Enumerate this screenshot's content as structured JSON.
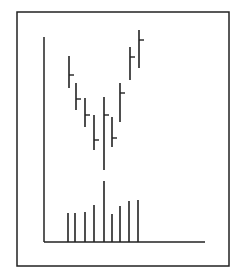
{
  "chart_data": {
    "type": "bar",
    "subtype": "ohlc-with-volume",
    "title": "",
    "xlabel": "",
    "ylabel": "",
    "grid": false,
    "legend": null,
    "frame": {
      "x": 17,
      "y": 12,
      "w": 212,
      "h": 254
    },
    "axes": {
      "origin_x": 44,
      "origin_y": 242,
      "y_top": 37,
      "x_end": 205
    },
    "categories": [
      1,
      2,
      3,
      4,
      5,
      6,
      7,
      8,
      9
    ],
    "price_bars": [
      {
        "x": 69,
        "high": 56,
        "low": 88,
        "close": 75
      },
      {
        "x": 76,
        "high": 83,
        "low": 110,
        "close": 99
      },
      {
        "x": 85,
        "high": 98,
        "low": 127,
        "close": 115
      },
      {
        "x": 94,
        "high": 115,
        "low": 150,
        "close": 140
      },
      {
        "x": 104,
        "high": 97,
        "low": 170,
        "close": 115
      },
      {
        "x": 112,
        "high": 117,
        "low": 147,
        "close": 138
      },
      {
        "x": 120,
        "high": 83,
        "low": 122,
        "close": 93
      },
      {
        "x": 130,
        "high": 47,
        "low": 80,
        "close": 57
      },
      {
        "x": 139,
        "high": 30,
        "low": 68,
        "close": 40
      }
    ],
    "volume_bars": [
      {
        "x": 68,
        "top": 213
      },
      {
        "x": 75,
        "top": 213
      },
      {
        "x": 85,
        "top": 212
      },
      {
        "x": 94,
        "top": 205
      },
      {
        "x": 104,
        "top": 181
      },
      {
        "x": 112,
        "top": 214
      },
      {
        "x": 120,
        "top": 206
      },
      {
        "x": 129,
        "top": 201
      },
      {
        "x": 138,
        "top": 200
      }
    ],
    "relative_values": {
      "price_high": [
        68,
        57,
        51,
        44,
        52,
        44,
        57,
        71,
        78
      ],
      "price_low": [
        55,
        44,
        37,
        28,
        20,
        31,
        47,
        60,
        65
      ],
      "price_close": [
        62,
        50,
        44,
        34,
        44,
        35,
        53,
        67,
        74
      ],
      "volume": [
        29,
        29,
        30,
        37,
        61,
        28,
        36,
        41,
        42
      ]
    },
    "colors": {
      "line": "#222222",
      "background": "#ffffff"
    }
  }
}
